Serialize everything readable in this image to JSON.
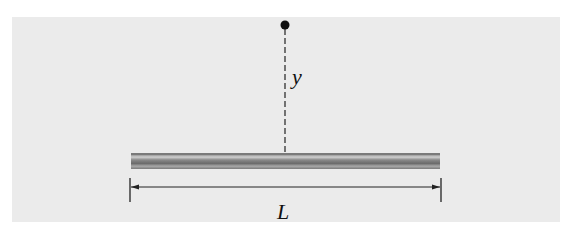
{
  "diagram": {
    "colors": {
      "background": "#ebebeb",
      "rod_dark": "#6e6e6e",
      "rod_light": "#c8c8c8",
      "line": "#222222"
    },
    "labels": {
      "distance": "y",
      "length": "L"
    }
  }
}
